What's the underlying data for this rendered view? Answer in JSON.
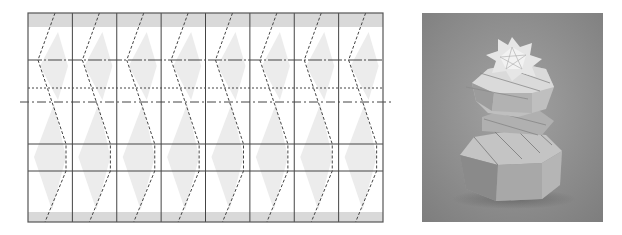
{
  "figure": {
    "type": "origami-crease-pattern-with-photo",
    "left_panel": {
      "name": "crease-pattern",
      "columns": 8,
      "bounds": {
        "x": 28,
        "y": 13,
        "width": 355,
        "height": 209
      },
      "bands": {
        "top": {
          "y": 13,
          "height": 14,
          "color": "#d9d9d9"
        },
        "bottom": {
          "y": 212,
          "height": 10,
          "color": "#d9d9d9"
        }
      },
      "horizontal_lines": [
        {
          "y": 60,
          "style": "mixed-solid-dashdot"
        },
        {
          "y": 88,
          "style": "dotted"
        },
        {
          "y": 102,
          "style": "long-dashdot",
          "extends": true
        },
        {
          "y": 144,
          "style": "solid"
        },
        {
          "y": 171,
          "style": "solid"
        }
      ],
      "line_color": "#444444",
      "shade_color": "#ececec"
    },
    "right_panel": {
      "name": "folded-model-photo",
      "description": "Photograph of a folded twisted octagonal tower, two stacked spiral tiers, grey backdrop",
      "background_color": "#8e8e8e"
    }
  }
}
